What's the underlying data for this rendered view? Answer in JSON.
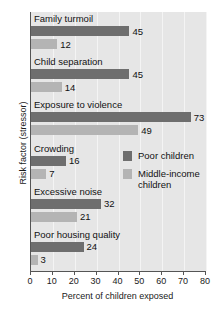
{
  "chart_data": {
    "type": "bar",
    "orientation": "horizontal",
    "title": "",
    "xlabel": "Percent of children exposed",
    "ylabel": "Risk factor (stressor)",
    "xlim": [
      0,
      80
    ],
    "xticks": [
      0,
      10,
      20,
      30,
      40,
      50,
      60,
      70,
      80
    ],
    "grid": true,
    "grid_axis": "x",
    "legend_position": "middle-right-inside",
    "categories": [
      "Family turmoil",
      "Child separation",
      "Exposure to violence",
      "Crowding",
      "Excessive noise",
      "Poor housing quality"
    ],
    "series": [
      {
        "name": "Poor children",
        "color": "#6e6e6e",
        "values": [
          45,
          45,
          73,
          16,
          32,
          24
        ]
      },
      {
        "name": "Middle-income children",
        "color": "#b4b4b4",
        "values": [
          12,
          14,
          49,
          7,
          21,
          3
        ]
      }
    ]
  },
  "legend": {
    "entries": [
      {
        "label": "Poor children",
        "label_line2": ""
      },
      {
        "label": "Middle-income",
        "label_line2": "children"
      }
    ]
  }
}
